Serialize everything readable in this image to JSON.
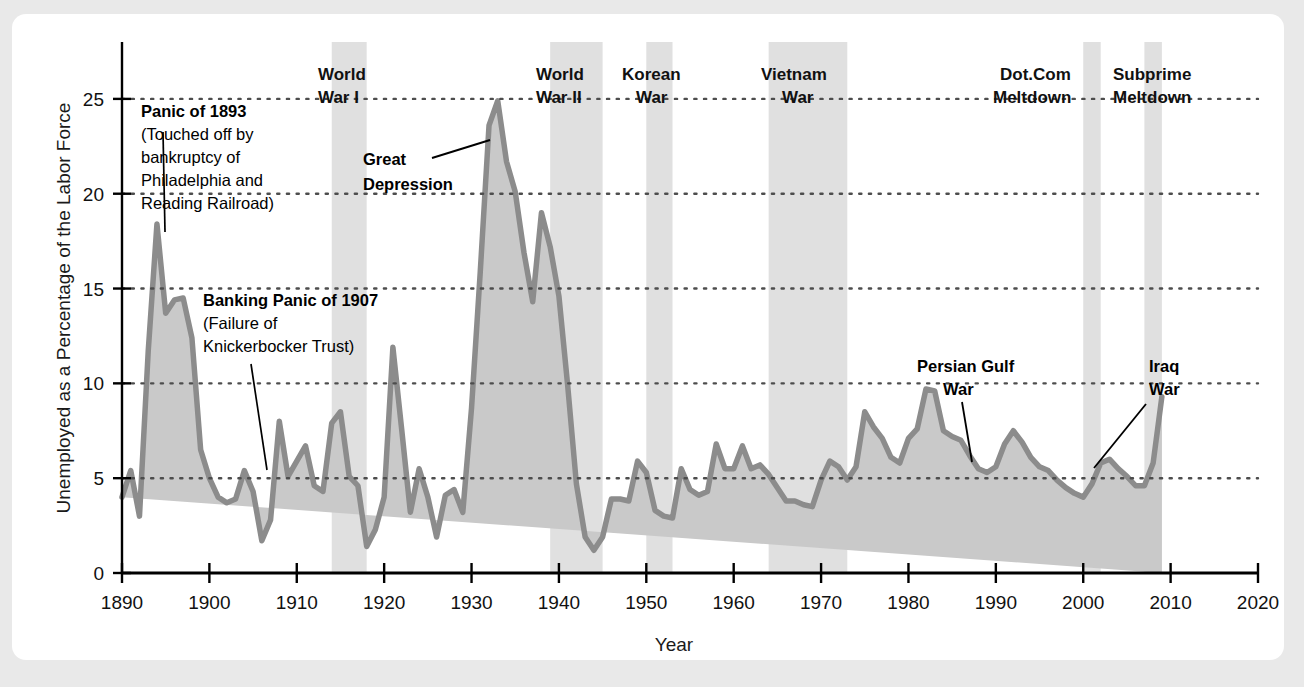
{
  "chart_data": {
    "type": "area",
    "title": "",
    "xlabel": "Year",
    "ylabel": "Unemployed as a Percentage of the Labor Force",
    "xlim": [
      1890,
      2020
    ],
    "ylim": [
      0,
      28
    ],
    "xticks": [
      1890,
      1900,
      1910,
      1920,
      1930,
      1940,
      1950,
      1960,
      1970,
      1980,
      1990,
      2000,
      2010,
      2020
    ],
    "yticks": [
      0,
      5,
      10,
      15,
      20,
      25
    ],
    "grid": "horizontal-dotted",
    "legend": "none",
    "series": [
      {
        "name": "Unemployment rate",
        "x": [
          1890,
          1891,
          1892,
          1893,
          1894,
          1895,
          1896,
          1897,
          1898,
          1899,
          1900,
          1901,
          1902,
          1903,
          1904,
          1905,
          1906,
          1907,
          1908,
          1909,
          1910,
          1911,
          1912,
          1913,
          1914,
          1915,
          1916,
          1917,
          1918,
          1919,
          1920,
          1921,
          1922,
          1923,
          1924,
          1925,
          1926,
          1927,
          1928,
          1929,
          1930,
          1931,
          1932,
          1933,
          1934,
          1935,
          1936,
          1937,
          1938,
          1939,
          1940,
          1941,
          1942,
          1943,
          1944,
          1945,
          1946,
          1947,
          1948,
          1949,
          1950,
          1951,
          1952,
          1953,
          1954,
          1955,
          1956,
          1957,
          1958,
          1959,
          1960,
          1961,
          1962,
          1963,
          1964,
          1965,
          1966,
          1967,
          1968,
          1969,
          1970,
          1971,
          1972,
          1973,
          1974,
          1975,
          1976,
          1977,
          1978,
          1979,
          1980,
          1981,
          1982,
          1983,
          1984,
          1985,
          1986,
          1987,
          1988,
          1989,
          1990,
          1991,
          1992,
          1993,
          1994,
          1995,
          1996,
          1997,
          1998,
          1999,
          2000,
          2001,
          2002,
          2003,
          2004,
          2005,
          2006,
          2007,
          2008,
          2009
        ],
        "values": [
          4.0,
          5.4,
          3.0,
          11.7,
          18.4,
          13.7,
          14.4,
          14.5,
          12.4,
          6.5,
          5.0,
          4.0,
          3.7,
          3.9,
          5.4,
          4.3,
          1.7,
          2.8,
          8.0,
          5.1,
          5.9,
          6.7,
          4.6,
          4.3,
          7.9,
          8.5,
          5.1,
          4.6,
          1.4,
          2.3,
          4.0,
          11.9,
          7.6,
          3.2,
          5.5,
          4.0,
          1.9,
          4.1,
          4.4,
          3.2,
          8.7,
          15.9,
          23.6,
          24.9,
          21.7,
          20.1,
          16.9,
          14.3,
          19.0,
          17.2,
          14.6,
          9.9,
          4.7,
          1.9,
          1.2,
          1.9,
          3.9,
          3.9,
          3.8,
          5.9,
          5.3,
          3.3,
          3.0,
          2.9,
          5.5,
          4.4,
          4.1,
          4.3,
          6.8,
          5.5,
          5.5,
          6.7,
          5.5,
          5.7,
          5.2,
          4.5,
          3.8,
          3.8,
          3.6,
          3.5,
          4.9,
          5.9,
          5.6,
          4.9,
          5.6,
          8.5,
          7.7,
          7.1,
          6.1,
          5.8,
          7.1,
          7.6,
          9.7,
          9.6,
          7.5,
          7.2,
          7.0,
          6.2,
          5.5,
          5.3,
          5.6,
          6.8,
          7.5,
          6.9,
          6.1,
          5.6,
          5.4,
          4.9,
          4.5,
          4.2,
          4.0,
          4.7,
          5.8,
          6.0,
          5.5,
          5.1,
          4.6,
          4.6,
          5.8,
          9.3
        ]
      }
    ],
    "shaded_bands": [
      {
        "label": "World War I",
        "start": 1914,
        "end": 1918,
        "label_line1": "World",
        "label_line2": "War I"
      },
      {
        "label": "World War II",
        "start": 1939,
        "end": 1945,
        "label_line1": "World",
        "label_line2": "War II"
      },
      {
        "label": "Korean War",
        "start": 1950,
        "end": 1953,
        "label_line1": "Korean",
        "label_line2": "War"
      },
      {
        "label": "Vietnam War",
        "start": 1964,
        "end": 1973,
        "label_line1": "Vietnam",
        "label_line2": "War"
      },
      {
        "label": "Dot.Com Meltdown",
        "start": 2000,
        "end": 2002,
        "label_line1": "Dot.Com",
        "label_line2": "Meltdown"
      },
      {
        "label": "Subprime Meltdown",
        "start": 2007,
        "end": 2009,
        "label_line1": "Subprime",
        "label_line2": "Meltdown"
      }
    ],
    "annotations": [
      {
        "id": "panic-1893",
        "title": "Panic of 1893",
        "lines": [
          "(Touched off by",
          "bankruptcy of",
          "Philadelphia and",
          "Reading Railroad)"
        ],
        "points_to_year": 1894
      },
      {
        "id": "banking-panic-1907",
        "title": "Banking Panic of 1907",
        "lines": [
          "(Failure of",
          "Knickerbocker Trust)"
        ],
        "points_to_year": 1908
      },
      {
        "id": "great-depression",
        "title": "Great Depression",
        "lines": [],
        "points_to_year": 1933
      },
      {
        "id": "persian-gulf-war",
        "title": "Persian Gulf War",
        "lines": [],
        "points_to_year": 1991
      },
      {
        "id": "iraq-war",
        "title": "Iraq War",
        "lines": [],
        "points_to_year": 2003
      }
    ],
    "colors": {
      "line": "#8c8c8c",
      "fill": "#c9c9c9",
      "band": "#e0e0e0",
      "axis": "#000000",
      "grid": "#4d4d4d",
      "page_background": "#e9e9e9",
      "card_background": "#ffffff"
    }
  },
  "labels": {
    "y_axis_title": "Unemployed as a Percentage of the Labor Force",
    "x_axis_title": "Year",
    "yticks": [
      "0",
      "5",
      "10",
      "15",
      "20",
      "25"
    ],
    "xticks": [
      "1890",
      "1900",
      "1910",
      "1920",
      "1930",
      "1940",
      "1950",
      "1960",
      "1970",
      "1980",
      "1990",
      "2000",
      "2010",
      "2020"
    ],
    "bands": {
      "ww1_l1": "World",
      "ww1_l2": "War I",
      "ww2_l1": "World",
      "ww2_l2": "War II",
      "korea_l1": "Korean",
      "korea_l2": "War",
      "vietnam_l1": "Vietnam",
      "vietnam_l2": "War",
      "dotcom_l1": "Dot.Com",
      "dotcom_l2": "Meltdown",
      "subprime_l1": "Subprime",
      "subprime_l2": "Meltdown"
    },
    "anno": {
      "p1893_t": "Panic of 1893",
      "p1893_1": "(Touched off by",
      "p1893_2": "bankruptcy of",
      "p1893_3": "Philadelphia and",
      "p1893_4": "Reading Railroad)",
      "bp1907_t": "Banking Panic of 1907",
      "bp1907_1": "(Failure of",
      "bp1907_2": "Knickerbocker Trust)",
      "gd_1": "Great",
      "gd_2": "Depression",
      "pgw_1": "Persian Gulf",
      "pgw_2": "War",
      "iraq_1": "Iraq",
      "iraq_2": "War"
    }
  }
}
